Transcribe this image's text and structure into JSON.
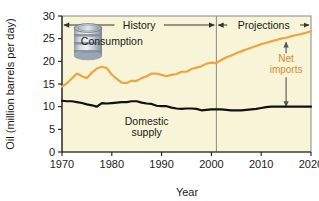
{
  "chart_data": {
    "type": "line",
    "title": "",
    "xlabel": "Year",
    "ylabel": "Oil (million barrels per day)",
    "xlim": [
      1970,
      2020
    ],
    "ylim": [
      0,
      30
    ],
    "xticks": [
      1970,
      1980,
      1990,
      2000,
      2010,
      2020
    ],
    "yticks": [
      0,
      5,
      10,
      15,
      20,
      25,
      30
    ],
    "grid": false,
    "legend_position": "inline-annotations",
    "plot_background": "#f7f4d8",
    "annotations": [
      {
        "name": "history-span",
        "text": "History",
        "x_start": 1970,
        "x_end": 2001,
        "y": 28
      },
      {
        "name": "projections-span",
        "text": "Projections",
        "x_start": 2001,
        "x_end": 2020,
        "y": 28
      },
      {
        "name": "net-imports-arrow",
        "text": "Net imports",
        "x": 2015,
        "y_top": 24.2,
        "y_bottom": 10.0
      },
      {
        "name": "divider",
        "x": 2001
      }
    ],
    "series": [
      {
        "name": "Consumption",
        "color": "#eda53f",
        "label_x": 1980,
        "label_y": 23.5,
        "x": [
          1970,
          1971,
          1972,
          1973,
          1974,
          1975,
          1976,
          1977,
          1978,
          1979,
          1980,
          1981,
          1982,
          1983,
          1984,
          1985,
          1986,
          1987,
          1988,
          1989,
          1990,
          1991,
          1992,
          1993,
          1994,
          1995,
          1996,
          1997,
          1998,
          1999,
          2000,
          2001,
          2002,
          2003,
          2004,
          2005,
          2006,
          2007,
          2008,
          2009,
          2010,
          2011,
          2012,
          2013,
          2014,
          2015,
          2016,
          2017,
          2018,
          2019,
          2020
        ],
        "values": [
          14.4,
          15.2,
          16.2,
          17.3,
          16.7,
          16.3,
          17.5,
          18.4,
          18.8,
          18.5,
          17.1,
          16.1,
          15.3,
          15.2,
          15.7,
          15.7,
          16.3,
          16.7,
          17.3,
          17.3,
          17.0,
          16.7,
          17.0,
          17.2,
          17.7,
          17.7,
          18.3,
          18.6,
          18.9,
          19.5,
          19.7,
          19.6,
          20.3,
          20.9,
          21.3,
          21.8,
          22.2,
          22.6,
          23.0,
          23.4,
          23.8,
          24.1,
          24.4,
          24.7,
          25.0,
          25.2,
          25.5,
          25.8,
          26.0,
          26.3,
          26.6
        ]
      },
      {
        "name": "Domestic supply",
        "color": "#111111",
        "label_x": 1987,
        "label_y": 6.0,
        "x": [
          1970,
          1971,
          1972,
          1973,
          1974,
          1975,
          1976,
          1977,
          1978,
          1979,
          1980,
          1981,
          1982,
          1983,
          1984,
          1985,
          1986,
          1987,
          1988,
          1989,
          1990,
          1991,
          1992,
          1993,
          1994,
          1995,
          1996,
          1997,
          1998,
          1999,
          2000,
          2001,
          2002,
          2003,
          2004,
          2005,
          2006,
          2007,
          2008,
          2009,
          2010,
          2011,
          2012,
          2013,
          2014,
          2015,
          2016,
          2017,
          2018,
          2019,
          2020
        ],
        "values": [
          11.3,
          11.2,
          11.2,
          11.0,
          10.8,
          10.5,
          10.3,
          10.0,
          10.8,
          10.7,
          10.8,
          10.9,
          11.0,
          11.0,
          11.2,
          11.2,
          10.9,
          10.7,
          10.6,
          10.2,
          10.1,
          10.1,
          9.8,
          9.6,
          9.5,
          9.6,
          9.6,
          9.5,
          9.2,
          9.3,
          9.4,
          9.4,
          9.4,
          9.3,
          9.2,
          9.2,
          9.2,
          9.3,
          9.4,
          9.5,
          9.7,
          9.9,
          10.0,
          10.0,
          10.0,
          10.0,
          10.0,
          10.0,
          10.0,
          10.0,
          10.0
        ]
      }
    ]
  },
  "decorations": {
    "oil_barrel_icon": "oil-barrel-icon"
  }
}
